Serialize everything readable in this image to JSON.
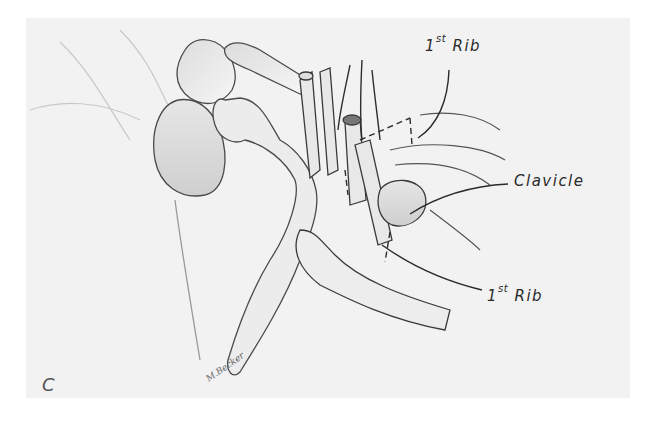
{
  "figure": {
    "panel_letter": "C",
    "signature": "M.Becker",
    "background_color": "#f2f2f2",
    "line_color": "#3a3a3a",
    "labels": [
      {
        "id": "rib_top",
        "ordinal": "1",
        "suffix": "st",
        "text": "Rib"
      },
      {
        "id": "clavicle",
        "text": "Clavicle"
      },
      {
        "id": "rib_bottom",
        "ordinal": "1",
        "suffix": "st",
        "text": "Rib"
      }
    ]
  }
}
